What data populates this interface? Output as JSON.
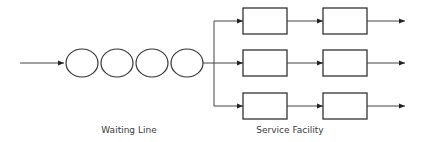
{
  "diagram": {
    "type": "queueing-system",
    "labels": {
      "waiting_line": "Waiting Line",
      "service_facility": "Service Facility"
    },
    "waiting_line": {
      "customers": 4
    },
    "service_facility": {
      "channels": 3,
      "phases": 2
    },
    "colors": {
      "stroke": "#333333",
      "background": "#ffffff",
      "text": "#3a3a3a"
    }
  }
}
